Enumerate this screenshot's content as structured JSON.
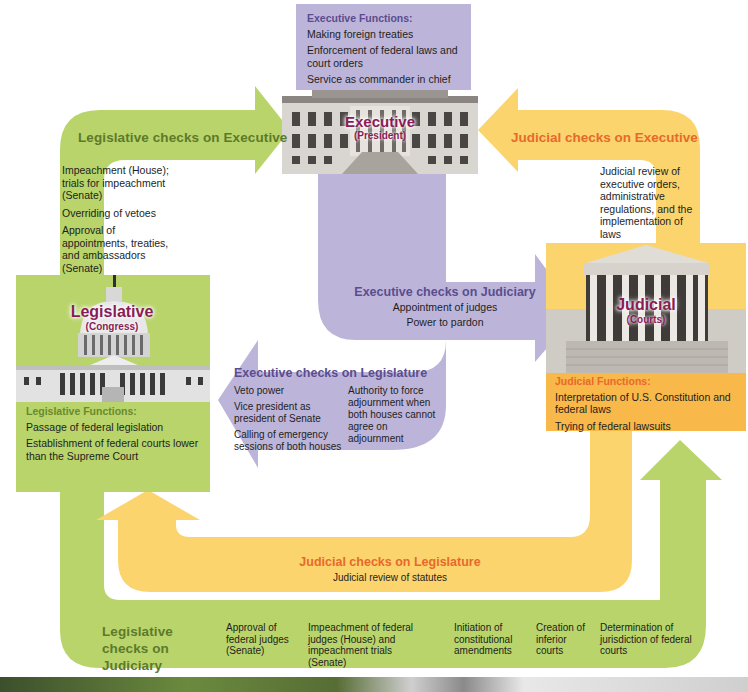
{
  "diagram_title": "Checks and Balances",
  "colors": {
    "legislative_green": "#b8d46a",
    "executive_purple": "#bdb5d9",
    "judicial_yellow": "#fbd46e",
    "judicial_orange": "#f8b84a",
    "label_magenta": "#8a1c55",
    "title_green": "#5d7a2a",
    "title_orange": "#e8692a",
    "title_purple": "#5a4d8f"
  },
  "executive": {
    "name": "Executive",
    "sub": "(President)",
    "functions_title": "Executive Functions:",
    "functions": [
      "Making foreign treaties",
      "Enforcement of federal laws and court orders",
      "Service as commander in chief"
    ]
  },
  "legislative": {
    "name": "Legislative",
    "sub": "(Congress)",
    "functions_title": "Legislative Functions:",
    "functions": [
      "Passage of federal legislation",
      "Establishment of federal courts lower than the Supreme Court"
    ]
  },
  "judicial": {
    "name": "Judicial",
    "sub": "(Courts)",
    "functions_title": "Judicial Functions:",
    "functions": [
      "Interpretation of U.S. Constitution and federal laws",
      "Trying of federal lawsuits"
    ]
  },
  "checks": {
    "leg_on_exec": {
      "title": "Legislative checks on Executive",
      "items": [
        "Impeachment (House); trials for impeachment (Senate)",
        "Overriding of vetoes",
        "Approval of appointments, treaties, and ambassadors (Senate)"
      ]
    },
    "jud_on_exec": {
      "title": "Judicial checks on Executive",
      "items": [
        "Judicial review of executive orders, administrative regulations, and the implementation of laws"
      ]
    },
    "exec_on_jud": {
      "title": "Executive checks on Judiciary",
      "items": [
        "Appointment of judges",
        "Power to pardon"
      ]
    },
    "exec_on_leg": {
      "title": "Executive checks on Legislature",
      "items_left": [
        "Veto power",
        "Vice president as president of Senate",
        "Calling of emergency sessions of both houses"
      ],
      "items_right": [
        "Authority to force adjournment when both houses cannot agree on adjournment"
      ]
    },
    "jud_on_leg": {
      "title": "Judicial checks on Legislature",
      "items": [
        "Judicial review of statutes"
      ]
    },
    "leg_on_jud": {
      "title": "Legislative checks on Judiciary",
      "items": [
        "Approval of federal judges (Senate)",
        "Impeachment of federal judges (House) and impeachment trials (Senate)",
        "Initiation of constitutional amendments",
        "Creation of inferior courts",
        "Determination of jurisdiction of federal courts"
      ]
    }
  }
}
